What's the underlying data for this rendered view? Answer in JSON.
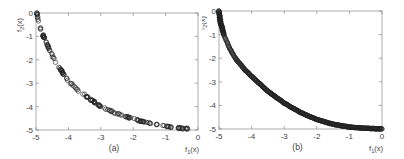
{
  "chart_data": [
    {
      "type": "scatter",
      "panel_label": "(a)",
      "xlabel": "f1(x)",
      "ylabel": "f2(x)",
      "xlim": [
        -5,
        0
      ],
      "ylim": [
        -5,
        0
      ],
      "xticks": [
        -5,
        -4,
        -3,
        -2,
        -1,
        0
      ],
      "yticks": [
        0,
        -1,
        -2,
        -3,
        -4,
        -5
      ],
      "marker": "open-circle",
      "density": "sparse",
      "description": "Pareto front: convex curve from (-5,0) to (0,-5), f2 = -5 + sqrt-like decay; points approximately follow (1 - sqrt(-f1... ))",
      "curve_samples": {
        "x": [
          -4.98,
          -4.9,
          -4.8,
          -4.6,
          -4.4,
          -4.2,
          -4.0,
          -3.7,
          -3.4,
          -3.0,
          -2.6,
          -2.2,
          -1.8,
          -1.4,
          -1.0,
          -0.7,
          -0.5,
          -0.3
        ],
        "y": [
          0.0,
          -0.5,
          -0.9,
          -1.5,
          -2.1,
          -2.5,
          -2.9,
          -3.3,
          -3.6,
          -4.0,
          -4.25,
          -4.45,
          -4.6,
          -4.75,
          -4.85,
          -4.9,
          -4.93,
          -4.95
        ]
      }
    },
    {
      "type": "scatter",
      "panel_label": "(b)",
      "xlabel": "f1(x)",
      "ylabel": "f2(x)",
      "xlim": [
        -5,
        0
      ],
      "ylim": [
        -5,
        0
      ],
      "xticks": [
        -5,
        -4,
        -3,
        -2,
        -1,
        0
      ],
      "yticks": [
        0,
        -1,
        -2,
        -3,
        -4,
        -5
      ],
      "marker": "open-circle",
      "density": "dense",
      "description": "Dense, uniformly distributed Pareto front from (-5,0) to (0,-5)",
      "curve_samples": {
        "x": [
          -5.0,
          -4.95,
          -4.85,
          -4.7,
          -4.5,
          -4.2,
          -3.9,
          -3.5,
          -3.0,
          -2.5,
          -2.0,
          -1.5,
          -1.0,
          -0.5,
          0.0
        ],
        "y": [
          0.0,
          -0.5,
          -1.0,
          -1.5,
          -2.0,
          -2.5,
          -2.9,
          -3.4,
          -3.9,
          -4.3,
          -4.6,
          -4.8,
          -4.92,
          -4.97,
          -5.0
        ]
      }
    }
  ]
}
